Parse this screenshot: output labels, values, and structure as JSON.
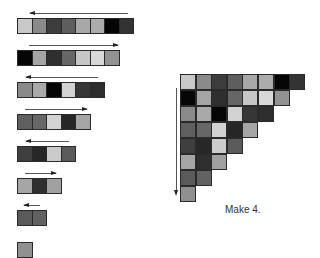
{
  "caption": "Make 4.",
  "left_rows": [
    {
      "direction": "left",
      "top": 18,
      "arrow": {
        "x1": 30,
        "x2": 128
      },
      "cells": [
        "#c8c8c8",
        "#8a8a8a",
        "#3c3c3c",
        "#5e5e5e",
        "#a8a8a8",
        "#acacac",
        "#050505",
        "#333333"
      ]
    },
    {
      "direction": "right",
      "top": 50,
      "arrow": {
        "x1": 29,
        "x2": 118
      },
      "cells": [
        "#060606",
        "#a5a5a5",
        "#2f2f2f",
        "#666666",
        "#c6c6c6",
        "#d8d8d8",
        "#929292"
      ]
    },
    {
      "direction": "left",
      "top": 82,
      "arrow": {
        "x1": 26,
        "x2": 98
      },
      "cells": [
        "#8a8a8a",
        "#a9a9a9",
        "#050505",
        "#d2d2d2",
        "#363636",
        "#2d2d2d"
      ]
    },
    {
      "direction": "right",
      "top": 114,
      "arrow": {
        "x1": 25,
        "x2": 87
      },
      "cells": [
        "#5f5f5f",
        "#676767",
        "#d3d3d3",
        "#262626",
        "#a5a5a5"
      ]
    },
    {
      "direction": "left",
      "top": 146,
      "arrow": {
        "x1": 26,
        "x2": 69
      },
      "cells": [
        "#3f3f3f",
        "#272727",
        "#cbcbcb",
        "#5a5a5a"
      ]
    },
    {
      "direction": "right",
      "top": 178,
      "arrow": {
        "x1": 25,
        "x2": 56
      },
      "cells": [
        "#a6a6a6",
        "#2f2f2f",
        "#a0a0a0"
      ]
    },
    {
      "direction": "left",
      "top": 210,
      "arrow": {
        "x1": 24,
        "x2": 40
      },
      "cells": [
        "#5a5a5a",
        "#626262"
      ]
    },
    {
      "direction": "none",
      "top": 242,
      "arrow": null,
      "cells": [
        "#909090"
      ]
    }
  ],
  "triangle": {
    "arrow_direction": "down",
    "rows": [
      [
        "#c8c8c8",
        "#8a8a8a",
        "#3c3c3c",
        "#5e5e5e",
        "#a8a8a8",
        "#acacac",
        "#050505",
        "#333333"
      ],
      [
        "#060606",
        "#a5a5a5",
        "#2f2f2f",
        "#666666",
        "#c6c6c6",
        "#d8d8d8",
        "#929292"
      ],
      [
        "#8a8a8a",
        "#a9a9a9",
        "#050505",
        "#d2d2d2",
        "#363636",
        "#2d2d2d"
      ],
      [
        "#5f5f5f",
        "#676767",
        "#d3d3d3",
        "#262626",
        "#a5a5a5"
      ],
      [
        "#3f3f3f",
        "#272727",
        "#cbcbcb",
        "#5a5a5a"
      ],
      [
        "#a6a6a6",
        "#2f2f2f",
        "#a0a0a0"
      ],
      [
        "#5a5a5a",
        "#626262"
      ],
      [
        "#909090"
      ]
    ]
  }
}
